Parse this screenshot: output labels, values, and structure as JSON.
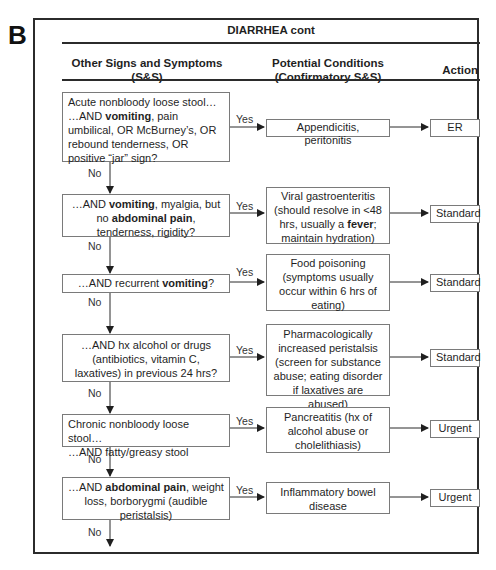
{
  "panel_label": "B",
  "title": "DIARRHEA cont",
  "columns": {
    "signs": [
      "Other Signs and Symptoms",
      "(S&S)"
    ],
    "conditions": [
      "Potential Conditions",
      "(Confirmatory S&S)"
    ],
    "action": "Action"
  },
  "labels": {
    "yes": "Yes",
    "no": "No"
  },
  "rows": [
    {
      "question_html": "Acute nonbloody loose stool…<br>…AND <b>vomiting</b>, pain umbilical, OR McBurney’s, OR rebound tenderness, OR positive “jar” sign?",
      "question_text": "Acute nonbloody loose stool… …AND vomiting, pain umbilical, OR McBurney’s, OR rebound tenderness, OR positive “jar” sign?",
      "condition": "Appendicitis, peritonitis",
      "action": "ER"
    },
    {
      "question_html": "…AND <b>vomiting</b>, myalgia, but no <b>abdominal pain</b>, tenderness, rigidity?",
      "question_text": "…AND vomiting, myalgia, but no abdominal pain, tenderness, rigidity?",
      "condition_html": "Viral gastroenteritis (should resolve in &lt;48 hrs, usually a <b>fever</b>; maintain hydration)",
      "condition": "Viral gastroenteritis (should resolve in <48 hrs, usually a fever; maintain hydration)",
      "action": "Standard"
    },
    {
      "question_html": "…AND recurrent <b>vomiting</b>?",
      "question_text": "…AND recurrent vomiting?",
      "condition": "Food poisoning (symptoms usually occur within 6 hrs of eating)",
      "action": "Standard"
    },
    {
      "question_html": "…AND hx alcohol or drugs (antibiotics, vitamin C, laxatives) in previous 24 hrs?",
      "question_text": "…AND hx alcohol or drugs (antibiotics, vitamin C, laxatives) in previous 24 hrs?",
      "condition": "Pharmacologically increased peristalsis (screen for substance abuse; eating disorder if laxatives are abused)",
      "action": "Standard"
    },
    {
      "question_html": "Chronic nonbloody loose stool…<br>…AND fatty/greasy stool",
      "question_text": "Chronic nonbloody loose stool… …AND fatty/greasy stool",
      "condition": "Pancreatitis (hx of alcohol abuse or cholelithiasis)",
      "action": "Urgent"
    },
    {
      "question_html": "…AND <b>abdominal pain</b>, weight loss, borborygmi (audible peristalsis)",
      "question_text": "…AND abdominal pain, weight loss, borborygmi (audible peristalsis)",
      "condition": "Inflammatory bowel disease",
      "action": "Urgent"
    }
  ],
  "colors": {
    "line": "#2b2b2b",
    "box_border": "#7a7a7a",
    "text": "#1f1f1f"
  }
}
